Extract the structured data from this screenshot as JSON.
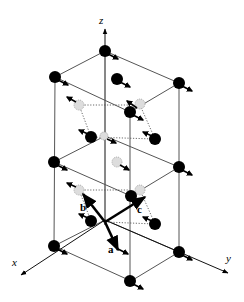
{
  "diagram": {
    "type": "crystal-structure",
    "axes": [
      {
        "name": "z",
        "label": "z"
      },
      {
        "name": "x",
        "label": "x"
      },
      {
        "name": "y",
        "label": "y"
      }
    ],
    "lattice_vectors": [
      {
        "name": "a",
        "label": "a"
      },
      {
        "name": "b",
        "label": "b"
      },
      {
        "name": "c",
        "label": "c"
      }
    ],
    "colors": {
      "atom": "#000000",
      "ghost_atom": "#dddddd",
      "edge": "#555555",
      "background": "#ffffff"
    }
  }
}
